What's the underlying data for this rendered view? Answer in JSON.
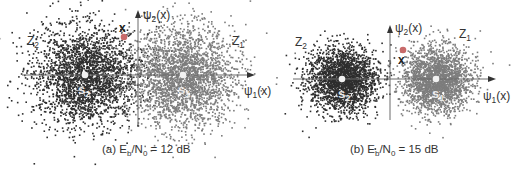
{
  "figure": {
    "panels": [
      {
        "id": "a",
        "caption_prefix": "(a) E",
        "caption_sub1": "b",
        "caption_mid": "/N",
        "caption_sub2": "0",
        "caption_suffix": " = 12 dB",
        "snr_db": 12,
        "offset_x": 0,
        "axes": {
          "h_y": 75,
          "h_x1": 22,
          "h_x2": 255,
          "v_x": 138,
          "v_y1": 10,
          "v_y2": 127
        },
        "labels": {
          "psi2": "ψ",
          "psi2_sub": "2",
          "psi2_arg": "(x)",
          "psi1": "ψ",
          "psi1_sub": "1",
          "psi1_arg": "(x)",
          "z2": "Z",
          "z2_sub": "2",
          "z1": "Z",
          "z1_sub": "1",
          "s2": "s",
          "s2_sub": "2",
          "s1": "s",
          "s1_sub": "1",
          "x": "x"
        },
        "positions": {
          "psi2": [
            143,
            19
          ],
          "psi1": [
            244,
            95
          ],
          "z2": [
            27,
            45
          ],
          "z1": [
            232,
            45
          ],
          "s2": [
            78,
            94
          ],
          "s1": [
            178,
            94
          ],
          "x": [
            119,
            32
          ],
          "xpoint": [
            124,
            37
          ]
        },
        "clusters": [
          {
            "name": "s2",
            "cx": 85,
            "cy": 75,
            "sigma": 26,
            "n": 2600,
            "color": "#2e2e2e"
          },
          {
            "name": "s1",
            "cx": 183,
            "cy": 75,
            "sigma": 26,
            "n": 2600,
            "color": "#7d7d7d"
          }
        ]
      },
      {
        "id": "b",
        "caption_prefix": "(b) E",
        "caption_sub1": "b",
        "caption_mid": "/N",
        "caption_sub2": "0",
        "caption_suffix": " = 15 dB",
        "snr_db": 15,
        "offset_x": 0,
        "axes": {
          "h_y": 79,
          "h_x1": 293,
          "h_x2": 496,
          "v_x": 390,
          "v_y1": 25,
          "v_y2": 120
        },
        "labels": {
          "psi2": "ψ",
          "psi2_sub": "2",
          "psi2_arg": "(x)",
          "psi1": "ψ",
          "psi1_sub": "1",
          "psi1_arg": "(x)",
          "z2": "Z",
          "z2_sub": "2",
          "z1": "Z",
          "z1_sub": "1",
          "s2": "s",
          "s2_sub": "2",
          "s1": "s",
          "s1_sub": "1",
          "x": "x"
        },
        "positions": {
          "psi2": [
            395,
            32
          ],
          "psi1": [
            483,
            100
          ],
          "z2": [
            295,
            46
          ],
          "z1": [
            459,
            38
          ],
          "s2": [
            338,
            98
          ],
          "s1": [
            432,
            98
          ],
          "x": [
            398,
            64
          ],
          "xpoint": [
            403,
            50
          ]
        },
        "clusters": [
          {
            "name": "s2",
            "cx": 342,
            "cy": 79,
            "sigma": 17,
            "n": 2200,
            "color": "#2e2e2e"
          },
          {
            "name": "s1",
            "cx": 436,
            "cy": 79,
            "sigma": 17,
            "n": 2200,
            "color": "#7d7d7d"
          }
        ]
      }
    ],
    "colors": {
      "axis": "#6a6a6a",
      "signal_point": "#f2f2f2",
      "received_point": "#c86a6a",
      "label": "#333333"
    }
  }
}
